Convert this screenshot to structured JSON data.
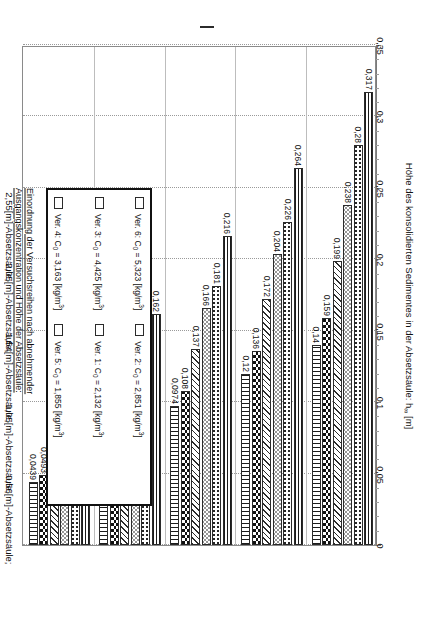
{
  "figure": {
    "legend_title_line1": "Einordnung der Versuchsreihen nach abnehmender",
    "legend_title_line2": "Ausgangskonzentration und Höhe der Absetzsäule:"
  },
  "legend": {
    "items": [
      {
        "label_prefix": "Ver. 6: C",
        "sub": "0",
        "eq": " = 5,323 [kg/m",
        "sup": "3",
        "close": "]",
        "pattern": "hlines"
      },
      {
        "label_prefix": "Ver. 3: C",
        "sub": "0",
        "eq": " = 4,425 [kg/m",
        "sup": "3",
        "close": "]",
        "pattern": "dots-sparse"
      },
      {
        "label_prefix": "Ver. 4: C",
        "sub": "0",
        "eq": " = 3,163 [kg/m",
        "sup": "3",
        "close": "]",
        "pattern": "circles"
      },
      {
        "label_prefix": "Ver. 2: C",
        "sub": "0",
        "eq": " = 2,851 [kg/m",
        "sup": "3",
        "close": "]",
        "pattern": "diag"
      },
      {
        "label_prefix": "Ver. 1: C",
        "sub": "0",
        "eq": " = 2,132 [kg/m",
        "sup": "3",
        "close": "]",
        "pattern": "blotch"
      },
      {
        "label_prefix": "Ver. 5: C",
        "sub": "0",
        "eq": " = 1,855 [kg/m",
        "sup": "3",
        "close": "]",
        "pattern": "vlines"
      }
    ]
  },
  "chart_data": {
    "type": "bar",
    "orientation": "horizontal",
    "title": "Einordnung der Versuchsreihen nach abnehmender Ausgangskonzentration und Höhe der Absetzsäule:",
    "xlabel": "Höhe des konsolidierten Sedimentes in der Absetzsäule: h∞ [m]",
    "ylabel": "",
    "xlim": [
      0,
      0.35
    ],
    "grid": true,
    "legend_position": "inside-upper-left",
    "tick_labels": [
      "0,35",
      "0,3",
      "0,25",
      "0,2",
      "0,15",
      "0,1",
      "0,05",
      "0"
    ],
    "tick_values": [
      0.35,
      0.3,
      0.25,
      0.2,
      0.15,
      0.1,
      0.05,
      0
    ],
    "categories": [
      "2,55[m]-Absetzsäule;",
      "2,05[m]-Absetzsäule;",
      "1,54[m]-Absetzsäule;",
      "1,05[m]-Absetzsäule;",
      "0,56[m]-Absetzsäule;"
    ],
    "series": [
      {
        "name": "Ver. 6: C0 = 5,323 [kg/m3]",
        "pattern": "hlines",
        "values": [
          0.317,
          0.264,
          0.216,
          0.162,
          0.101
        ],
        "labels": [
          "0,317",
          "0,264",
          "0,216",
          "0,162",
          "0,101"
        ]
      },
      {
        "name": "Ver. 3: C0 = 4,425 [kg/m3]",
        "pattern": "dots-sparse",
        "values": [
          0.28,
          0.226,
          0.181,
          0.138,
          0.0876
        ],
        "labels": [
          "0,28",
          "0,226",
          "0,181",
          "0,138",
          "0,0876"
        ]
      },
      {
        "name": "Ver. 4: C0 = 3,163 [kg/m3]",
        "pattern": "circles",
        "values": [
          0.238,
          0.204,
          0.166,
          0.124,
          0.0748
        ],
        "labels": [
          "0,238",
          "0,204",
          "0,166",
          "0,124",
          "0,0748"
        ]
      },
      {
        "name": "Ver. 2: C0 = 2,851 [kg/m3]",
        "pattern": "diag",
        "values": [
          0.199,
          0.172,
          0.137,
          0.101,
          0.0624
        ],
        "labels": [
          "0,199",
          "0,172",
          "0,137",
          "0,101",
          "0,0624"
        ]
      },
      {
        "name": "Ver. 1: C0 = 2,132 [kg/m3]",
        "pattern": "blotch",
        "values": [
          0.159,
          0.136,
          0.108,
          0.0812,
          0.0493
        ],
        "labels": [
          "0,159",
          "0,136",
          "0,108",
          "0,0812",
          "0,0493"
        ]
      },
      {
        "name": "Ver. 5: C0 = 1,855 [kg/m3]",
        "pattern": "vlines",
        "values": [
          0.14,
          0.12,
          0.0974,
          0.073,
          0.0439
        ],
        "labels": [
          "0,14",
          "0,12",
          "0,0974",
          "0,073",
          "0,0439"
        ]
      }
    ]
  }
}
